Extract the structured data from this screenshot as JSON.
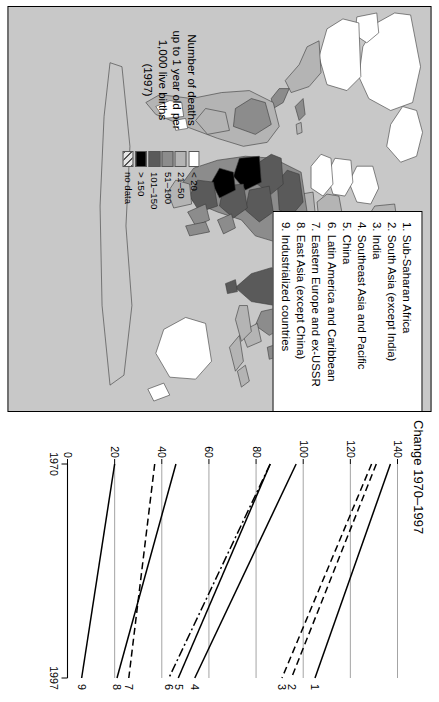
{
  "map": {
    "panel_name": "world-infant-mortality-map",
    "background_color": "#c8c8c8",
    "key": {
      "title_lines": [
        "Number of deaths",
        "up to 1 year old per",
        "1,000 live births",
        "(1997)"
      ],
      "classes": [
        {
          "label": "< 20",
          "color": "#ffffff",
          "pattern": "solid"
        },
        {
          "label": "21–50",
          "color": "#b4b4b4",
          "pattern": "solid"
        },
        {
          "label": "51–100",
          "color": "#8c8c8c",
          "pattern": "solid"
        },
        {
          "label": "101–150",
          "color": "#5a5a5a",
          "pattern": "solid"
        },
        {
          "label": "> 150",
          "color": "#000000",
          "pattern": "solid"
        },
        {
          "label": "no data",
          "color": "#e0e0e0",
          "pattern": "hatch"
        }
      ]
    }
  },
  "region_legend": {
    "items": [
      "1. Sub-Saharan Africa",
      "2. South Asia (except India)",
      "3. India",
      "4. Southeast Asia and Pacific",
      "5. China",
      "6. Latin America and Caribbean",
      "7. Eastern Europe and ex-USSR",
      "8. East Asia (except China)",
      "9. Industrialized countries"
    ]
  },
  "chart_data": {
    "type": "line",
    "title": "Change 1970–1997",
    "xlabel": "",
    "ylabel": "",
    "x": [
      1970,
      1997
    ],
    "xticklabels": [
      "1970",
      "1997"
    ],
    "xlim": [
      1970,
      1997
    ],
    "ylim": [
      0,
      140
    ],
    "yticks": [
      0,
      20,
      40,
      60,
      80,
      100,
      120,
      140
    ],
    "yticklabels": [
      "0",
      "20",
      "40",
      "60",
      "80",
      "100",
      "120",
      "140"
    ],
    "grid": "horizontal",
    "legend_position": "line-end-labels",
    "series": [
      {
        "name": "1",
        "label": "1. Sub-Saharan Africa",
        "values": [
          137,
          105
        ],
        "style": "solid"
      },
      {
        "name": "2",
        "label": "2. South Asia (except India)",
        "values": [
          131,
          95
        ],
        "style": "dashed"
      },
      {
        "name": "3",
        "label": "3. India",
        "values": [
          129,
          91
        ],
        "style": "dashed"
      },
      {
        "name": "4",
        "label": "4. Southeast Asia and Pacific",
        "values": [
          97,
          54
        ],
        "style": "solid"
      },
      {
        "name": "5",
        "label": "5. China",
        "values": [
          86,
          47
        ],
        "style": "solid"
      },
      {
        "name": "6",
        "label": "6. Latin America and Caribbean",
        "values": [
          86,
          43
        ],
        "style": "dashdot"
      },
      {
        "name": "7",
        "label": "7. Eastern Europe and ex-USSR",
        "values": [
          37,
          26
        ],
        "style": "dashed"
      },
      {
        "name": "8",
        "label": "8. East Asia (except China)",
        "values": [
          46,
          21
        ],
        "style": "solid"
      },
      {
        "name": "9",
        "label": "9. Industrialized countries",
        "values": [
          20,
          6
        ],
        "style": "solid"
      }
    ]
  }
}
